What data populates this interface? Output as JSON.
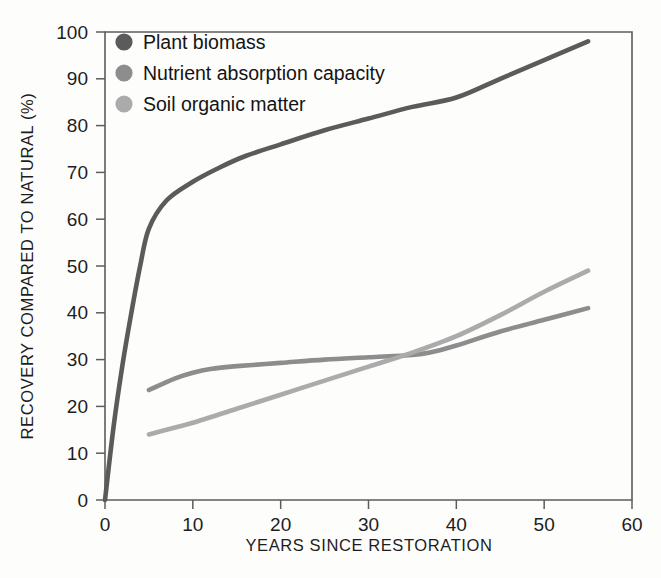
{
  "chart_data": {
    "type": "line",
    "title": "",
    "xlabel": "YEARS SINCE RESTORATION",
    "ylabel": "RECOVERY COMPARED TO NATURAL (%)",
    "xlim": [
      0,
      60
    ],
    "ylim": [
      0,
      100
    ],
    "xticks": [
      0,
      10,
      20,
      30,
      40,
      50,
      60
    ],
    "yticks": [
      0,
      10,
      20,
      30,
      40,
      50,
      60,
      70,
      80,
      90,
      100
    ],
    "xtick_labels": [
      "0",
      "10",
      "20",
      "30",
      "40",
      "50",
      "60"
    ],
    "ytick_labels": [
      "0",
      "10",
      "20",
      "30",
      "40",
      "50",
      "60",
      "70",
      "80",
      "90",
      "100"
    ],
    "grid": false,
    "legend_position": "top-left",
    "series": [
      {
        "name": "Plant biomass",
        "color": "#5b5b5b",
        "x": [
          0,
          1,
          2,
          3,
          4,
          5,
          7,
          10,
          13,
          16,
          20,
          25,
          30,
          35,
          40,
          45,
          50,
          55
        ],
        "values": [
          0,
          16,
          29,
          40,
          50,
          58,
          64,
          68,
          71,
          73.5,
          76,
          79,
          81.5,
          84,
          86,
          90,
          94,
          98
        ]
      },
      {
        "name": "Nutrient absorption capacity",
        "color": "#8d8d8d",
        "x": [
          5,
          8,
          10,
          12,
          15,
          20,
          25,
          30,
          35,
          37,
          40,
          45,
          50,
          55
        ],
        "values": [
          23.5,
          26,
          27.2,
          28,
          28.6,
          29.3,
          30,
          30.5,
          31,
          31.5,
          33,
          36,
          38.5,
          41
        ]
      },
      {
        "name": "Soil organic matter",
        "color": "#ababab",
        "x": [
          5,
          8,
          10,
          15,
          20,
          25,
          30,
          35,
          40,
          45,
          50,
          55
        ],
        "values": [
          14,
          15.5,
          16.5,
          19.5,
          22.5,
          25.5,
          28.5,
          31.5,
          35,
          39.5,
          44.5,
          49
        ]
      }
    ]
  },
  "legend": {
    "items": [
      {
        "label": "Plant biomass",
        "color": "#5b5b5b"
      },
      {
        "label": "Nutrient absorption capacity",
        "color": "#8d8d8d"
      },
      {
        "label": "Soil organic matter",
        "color": "#ababab"
      }
    ]
  },
  "axes": {
    "x_title": "YEARS SINCE RESTORATION",
    "y_title": "RECOVERY COMPARED TO NATURAL (%)"
  }
}
